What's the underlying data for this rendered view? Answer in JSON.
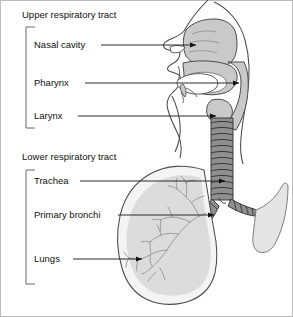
{
  "figure": {
    "background": "#ffffff",
    "frame_color": "#b4b4b4"
  },
  "groups": [
    {
      "id": "upper",
      "title": "Upper respiratory tract",
      "title_x": 22,
      "title_y": 18,
      "bracket": {
        "x": 26,
        "y_top": 27,
        "y_bottom": 128,
        "arm": 9
      },
      "labels": [
        {
          "name": "nasal-cavity",
          "text": "Nasal cavity",
          "text_x": 34,
          "text_y": 48,
          "leader_x1": 101,
          "leader_y1": 45,
          "leader_x2": 196,
          "leader_y2": 45,
          "arrow": "right"
        },
        {
          "name": "pharynx",
          "text": "Pharynx",
          "text_x": 34,
          "text_y": 86,
          "leader_x1": 85,
          "leader_y1": 83,
          "leader_x2": 239,
          "leader_y2": 83,
          "arrow": "right"
        },
        {
          "name": "larynx",
          "text": "Larynx",
          "text_x": 34,
          "text_y": 119,
          "leader_x1": 78,
          "leader_y1": 116,
          "leader_x2": 216,
          "leader_y2": 116,
          "arrow": "right"
        }
      ]
    },
    {
      "id": "lower",
      "title": "Lower respiratory tract",
      "title_x": 22,
      "title_y": 160,
      "bracket": {
        "x": 26,
        "y_top": 170,
        "y_bottom": 284,
        "arm": 9
      },
      "labels": [
        {
          "name": "trachea",
          "text": "Trachea",
          "text_x": 34,
          "text_y": 184,
          "leader_x1": 80,
          "leader_y1": 181,
          "leader_x2": 225,
          "leader_y2": 181,
          "arrow": "right"
        },
        {
          "name": "primary-bronchi",
          "text": "Primary bronchi",
          "text_x": 34,
          "text_y": 218,
          "leader_x1": 118,
          "leader_y1": 215,
          "leader_x2": 214,
          "leader_y2": 215,
          "arrow": "right"
        },
        {
          "name": "lungs",
          "text": "Lungs",
          "text_x": 34,
          "text_y": 262,
          "leader_x1": 73,
          "leader_y1": 259,
          "leader_x2": 142,
          "leader_y2": 259,
          "arrow": "right"
        }
      ]
    }
  ],
  "anatomy": {
    "airway_fill": "#c9c9c9",
    "lung_outer_fill": "#f2f2f2",
    "lung_inner_fill": "#dcdcdc",
    "trachea_fill": "#8c8c8c",
    "outline": "#3a3a3a",
    "bronchial_tree_stroke": "#9a9a9a",
    "parts": [
      "head-sagittal-section",
      "nasal-cavity-chamber",
      "soft-palate",
      "tongue",
      "epiglottis",
      "pharynx-passage",
      "larynx",
      "trachea-rings",
      "carina",
      "left-primary-bronchus",
      "right-primary-bronchus",
      "lung-lobe",
      "bronchial-tree"
    ]
  }
}
